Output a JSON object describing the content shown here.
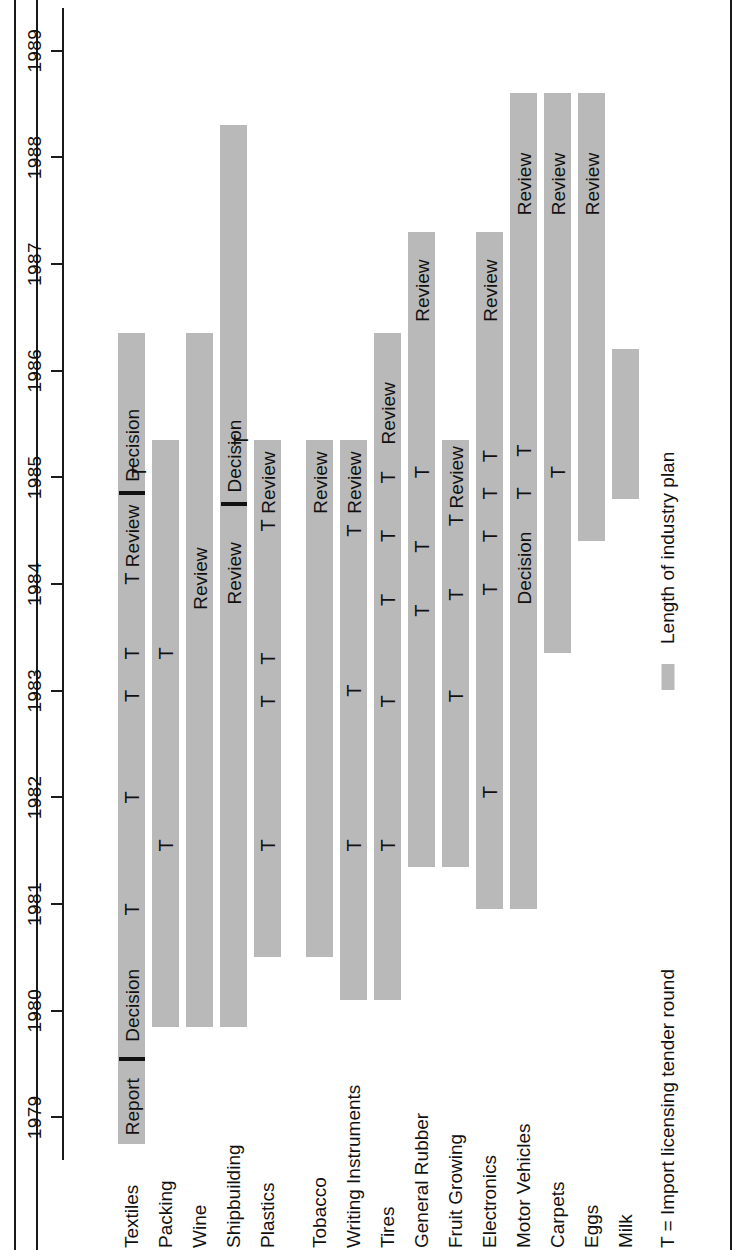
{
  "chart_data": {
    "type": "bar",
    "subtype": "gantt-timeline",
    "title": "",
    "xlabel": "",
    "ylabel": "",
    "orientation": "rotated-90-ccw",
    "axis": {
      "name": "Year",
      "ticks": [
        1979,
        1980,
        1981,
        1982,
        1983,
        1984,
        1985,
        1986,
        1987,
        1988,
        1989
      ],
      "tick_labels": [
        "1979",
        "1980",
        "1981",
        "1982",
        "1983",
        "1984",
        "1985",
        "1986",
        "1987",
        "1988",
        "1989"
      ],
      "range": [
        1978.6,
        1989.4
      ],
      "grid": false
    },
    "legend": {
      "position": "bottom",
      "tender_note": "T = Import licensing tender round",
      "plan_label": "Length of industry plan",
      "plan_color": "#b9b9b9"
    },
    "categories": [
      "Textiles",
      "Packing",
      "Wine",
      "Shipbuilding",
      "Plastics",
      "Tobacco",
      "Writing Instruments",
      "Tires",
      "General Rubber",
      "Fruit Growing",
      "Electronics",
      "Motor Vehicles",
      "Carpets",
      "Eggs",
      "Milk"
    ],
    "series": [
      {
        "name": "Textiles",
        "start": 1978.75,
        "end": 1986.35,
        "markers": [
          {
            "label": "Report",
            "year": 1979.1,
            "kind": "text"
          },
          {
            "label": "",
            "year": 1979.55,
            "kind": "dash"
          },
          {
            "label": "Decision",
            "year": 1980.05,
            "kind": "text"
          },
          {
            "label": "T",
            "year": 1980.95,
            "kind": "tender"
          },
          {
            "label": "T",
            "year": 1982.0,
            "kind": "tender"
          },
          {
            "label": "T",
            "year": 1982.95,
            "kind": "tender"
          },
          {
            "label": "T",
            "year": 1983.35,
            "kind": "tender"
          },
          {
            "label": "T",
            "year": 1984.05,
            "kind": "tender"
          },
          {
            "label": "Review",
            "year": 1984.45,
            "kind": "text"
          },
          {
            "label": "",
            "year": 1984.85,
            "kind": "dash"
          },
          {
            "label": "Decision",
            "year": 1985.3,
            "kind": "text"
          },
          {
            "label": "T",
            "year": 1985.05,
            "kind": "tender",
            "row": "low"
          }
        ]
      },
      {
        "name": "Packing",
        "start": 1979.85,
        "end": 1985.35,
        "markers": [
          {
            "label": "T",
            "year": 1981.55,
            "kind": "tender"
          },
          {
            "label": "T",
            "year": 1983.35,
            "kind": "tender"
          }
        ]
      },
      {
        "name": "Wine",
        "start": 1979.85,
        "end": 1986.35,
        "markers": [
          {
            "label": "Review",
            "year": 1984.05,
            "kind": "text"
          }
        ]
      },
      {
        "name": "Shipbuilding",
        "start": 1979.85,
        "end": 1988.3,
        "markers": [
          {
            "label": "Review",
            "year": 1984.1,
            "kind": "text"
          },
          {
            "label": "",
            "year": 1984.75,
            "kind": "dash"
          },
          {
            "label": "Decision",
            "year": 1985.2,
            "kind": "text"
          },
          {
            "label": "T",
            "year": 1985.35,
            "kind": "tender",
            "row": "low"
          }
        ]
      },
      {
        "name": "Plastics",
        "start": 1980.5,
        "end": 1985.35,
        "markers": [
          {
            "label": "T",
            "year": 1981.55,
            "kind": "tender"
          },
          {
            "label": "T",
            "year": 1982.9,
            "kind": "tender"
          },
          {
            "label": "T",
            "year": 1983.3,
            "kind": "tender"
          },
          {
            "label": "T",
            "year": 1984.55,
            "kind": "tender"
          },
          {
            "label": "Review",
            "year": 1984.95,
            "kind": "text"
          }
        ]
      },
      {
        "name": "Tobacco",
        "start": 1980.5,
        "end": 1985.35,
        "markers": [
          {
            "label": "Review",
            "year": 1984.95,
            "kind": "text"
          }
        ]
      },
      {
        "name": "Writing Instruments",
        "start": 1980.1,
        "end": 1985.35,
        "markers": [
          {
            "label": "T",
            "year": 1181.55,
            "kind": "tender"
          },
          {
            "label": "T",
            "year": 1981.55,
            "kind": "tender"
          },
          {
            "label": "T",
            "year": 1983.0,
            "kind": "tender"
          },
          {
            "label": "T",
            "year": 1984.5,
            "kind": "tender"
          },
          {
            "label": "Review",
            "year": 1984.95,
            "kind": "text"
          }
        ]
      },
      {
        "name": "Tires",
        "start": 1980.1,
        "end": 1986.35,
        "markers": [
          {
            "label": "T",
            "year": 1981.55,
            "kind": "tender"
          },
          {
            "label": "T",
            "year": 1982.9,
            "kind": "tender"
          },
          {
            "label": "T",
            "year": 1983.85,
            "kind": "tender"
          },
          {
            "label": "T",
            "year": 1984.45,
            "kind": "tender"
          },
          {
            "label": "T",
            "year": 1985.0,
            "kind": "tender"
          },
          {
            "label": "Review",
            "year": 1985.6,
            "kind": "text"
          }
        ]
      },
      {
        "name": "General Rubber",
        "start": 1981.35,
        "end": 1987.3,
        "markers": [
          {
            "label": "T",
            "year": 1983.75,
            "kind": "tender"
          },
          {
            "label": "T",
            "year": 1984.35,
            "kind": "tender"
          },
          {
            "label": "T",
            "year": 1985.05,
            "kind": "tender"
          },
          {
            "label": "Review",
            "year": 1986.75,
            "kind": "text"
          }
        ]
      },
      {
        "name": "Fruit Growing",
        "start": 1981.35,
        "end": 1985.35,
        "markers": [
          {
            "label": "T",
            "year": 1982.95,
            "kind": "tender"
          },
          {
            "label": "T",
            "year": 1983.9,
            "kind": "tender"
          },
          {
            "label": "T",
            "year": 1984.6,
            "kind": "tender"
          },
          {
            "label": "Review",
            "year": 1985.0,
            "kind": "text"
          }
        ]
      },
      {
        "name": "Electronics",
        "start": 1980.95,
        "end": 1987.3,
        "markers": [
          {
            "label": "T",
            "year": 1982.05,
            "kind": "tender"
          },
          {
            "label": "T",
            "year": 1983.95,
            "kind": "tender"
          },
          {
            "label": "T",
            "year": 1984.45,
            "kind": "tender"
          },
          {
            "label": "T",
            "year": 1984.85,
            "kind": "tender"
          },
          {
            "label": "T",
            "year": 1985.2,
            "kind": "tender"
          },
          {
            "label": "Review",
            "year": 1986.75,
            "kind": "text"
          }
        ]
      },
      {
        "name": "Motor Vehicles",
        "start": 1980.95,
        "end": 1988.6,
        "markers": [
          {
            "label": "Decision",
            "year": 1984.15,
            "kind": "text"
          },
          {
            "label": "T",
            "year": 1984.85,
            "kind": "tender"
          },
          {
            "label": "T",
            "year": 1985.25,
            "kind": "tender"
          },
          {
            "label": "Review",
            "year": 1987.75,
            "kind": "text"
          }
        ]
      },
      {
        "name": "Carpets",
        "start": 1983.35,
        "end": 1988.6,
        "markers": [
          {
            "label": "T",
            "year": 1985.05,
            "kind": "tender"
          },
          {
            "label": "Review",
            "year": 1987.75,
            "kind": "text"
          }
        ]
      },
      {
        "name": "Eggs",
        "start": 1984.4,
        "end": 1988.6,
        "markers": [
          {
            "label": "Review",
            "year": 1987.75,
            "kind": "text"
          }
        ]
      },
      {
        "name": "Milk",
        "start": 1984.8,
        "end": 1986.2,
        "markers": []
      }
    ]
  }
}
